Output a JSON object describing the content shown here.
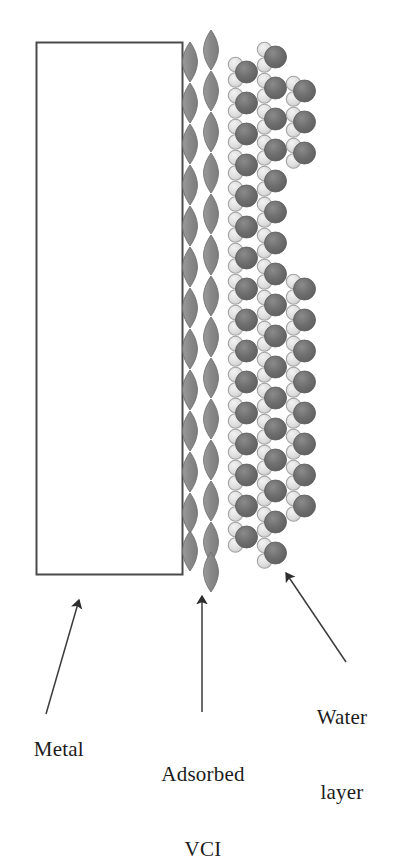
{
  "figure": {
    "background_color": "#ffffff"
  },
  "metal": {
    "label": "Metal",
    "shape": "rectangle",
    "stroke_color": "#4a4a4a",
    "fill_color": "#ffffff",
    "x": 36,
    "y": 42,
    "width": 147,
    "height": 533
  },
  "vci": {
    "label_line1": "Adsorbed",
    "label_line2": "VCI",
    "label": "Adsorbed VCI",
    "molecule_shape": "lens-ellipse",
    "fill_color": "#8e8e8e",
    "stroke_color": "#6e6e6e",
    "columns": 2,
    "column_x": [
      190,
      211
    ],
    "ellipse_width": 15,
    "ellipse_height": 40,
    "count_column_1": 13,
    "count_column_2": 14
  },
  "water": {
    "label_line1": "Water",
    "label_line2": "layer",
    "label": "Water layer",
    "molecule_shape": "oxygen-sphere-with-two-hydrogen-lobes",
    "oxygen_color": "#6f6f6f",
    "hydrogen_color": "#d8d8d8",
    "hydrogen_stroke": "#9a9a9a",
    "columns": 3,
    "column_x": [
      243,
      272,
      301
    ],
    "oxygen_radius": 11,
    "hydrogen_radius": 7
  },
  "arrows": {
    "color": "#3c3c3c",
    "metal_arrow": {
      "name": "metal-arrow",
      "from_x": 46,
      "from_y": 714,
      "to_x": 79,
      "to_y": 598
    },
    "vci_arrow": {
      "name": "vci-arrow",
      "from_x": 202,
      "from_y": 712,
      "to_x": 202,
      "to_y": 594
    },
    "water_arrow": {
      "name": "water-arrow",
      "from_x": 346,
      "from_y": 662,
      "to_x": 284,
      "to_y": 570
    }
  }
}
